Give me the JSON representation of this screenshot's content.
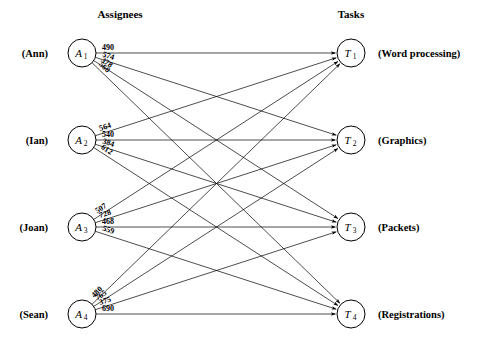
{
  "headers": {
    "left": "Assignees",
    "right": "Tasks"
  },
  "assignees": [
    {
      "id": "A1",
      "symbol": "A",
      "index": "1",
      "person": "(Ann)"
    },
    {
      "id": "A2",
      "symbol": "A",
      "index": "2",
      "person": "(Ian)"
    },
    {
      "id": "A3",
      "symbol": "A",
      "index": "3",
      "person": "(Joan)"
    },
    {
      "id": "A4",
      "symbol": "A",
      "index": "4",
      "person": "(Sean)"
    }
  ],
  "tasks": [
    {
      "id": "T1",
      "symbol": "T",
      "index": "1",
      "name": "(Word processing)"
    },
    {
      "id": "T2",
      "symbol": "T",
      "index": "2",
      "name": "(Graphics)"
    },
    {
      "id": "T3",
      "symbol": "T",
      "index": "3",
      "name": "(Packets)"
    },
    {
      "id": "T4",
      "symbol": "T",
      "index": "4",
      "name": "(Registrations)"
    }
  ],
  "edges": [
    {
      "from": "A1",
      "to": "T1",
      "weight": "490"
    },
    {
      "from": "A1",
      "to": "T2",
      "weight": "574"
    },
    {
      "from": "A1",
      "to": "T3",
      "weight": "378"
    },
    {
      "from": "A1",
      "to": "T4",
      "weight": "560"
    },
    {
      "from": "A2",
      "to": "T1",
      "weight": "564"
    },
    {
      "from": "A2",
      "to": "T2",
      "weight": "540"
    },
    {
      "from": "A2",
      "to": "T3",
      "weight": "384"
    },
    {
      "from": "A2",
      "to": "T4",
      "weight": "612"
    },
    {
      "from": "A3",
      "to": "T1",
      "weight": "507"
    },
    {
      "from": "A3",
      "to": "T2",
      "weight": "728"
    },
    {
      "from": "A3",
      "to": "T3",
      "weight": "468"
    },
    {
      "from": "A3",
      "to": "T4",
      "weight": "559"
    },
    {
      "from": "A4",
      "to": "T1",
      "weight": "480"
    },
    {
      "from": "A4",
      "to": "T2",
      "weight": "765"
    },
    {
      "from": "A4",
      "to": "T3",
      "weight": "375"
    },
    {
      "from": "A4",
      "to": "T4",
      "weight": "690"
    }
  ],
  "chart_data": {
    "type": "diagram",
    "subtype": "bipartite-assignment-graph",
    "title": "",
    "left_group_label": "Assignees",
    "right_group_label": "Tasks",
    "left_nodes": [
      "A1",
      "A2",
      "A3",
      "A4"
    ],
    "right_nodes": [
      "T1",
      "T2",
      "T3",
      "T4"
    ],
    "left_node_names": [
      "Ann",
      "Ian",
      "Joan",
      "Sean"
    ],
    "right_node_names": [
      "Word processing",
      "Graphics",
      "Packets",
      "Registrations"
    ],
    "cost_matrix": [
      [
        490,
        574,
        378,
        560
      ],
      [
        564,
        540,
        384,
        612
      ],
      [
        507,
        728,
        468,
        559
      ],
      [
        480,
        765,
        375,
        690
      ]
    ],
    "matrix_rows": [
      "A1",
      "A2",
      "A3",
      "A4"
    ],
    "matrix_cols": [
      "T1",
      "T2",
      "T3",
      "T4"
    ],
    "directed": true,
    "complete_bipartite": true
  },
  "geometry": {
    "node_radius": 14,
    "left_x": 82,
    "right_x": 351,
    "rows_y": [
      53,
      140,
      227,
      314
    ],
    "label_x_left": 48,
    "label_x_right": 378,
    "header_left_x": 120,
    "header_right_x": 351,
    "header_y": 18
  },
  "colors": {
    "background": "#ffffff",
    "stroke": "#000000",
    "text": "#000000"
  }
}
